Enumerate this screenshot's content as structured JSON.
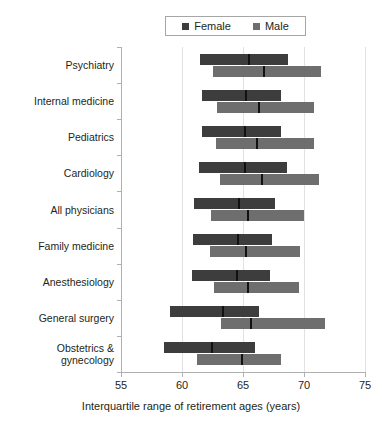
{
  "legend": {
    "items": [
      {
        "label": "Female",
        "color": "#3d3d3d",
        "swatch_name": "legend-swatch-female"
      },
      {
        "label": "Male",
        "color": "#6e6e6e",
        "swatch_name": "legend-swatch-male"
      }
    ]
  },
  "axis": {
    "x_title": "Interquartile range of retirement ages (years)",
    "x_ticks": [
      "55",
      "60",
      "65",
      "70",
      "75"
    ]
  },
  "chart_data": {
    "type": "bar",
    "subtype": "interquartile-range-bars",
    "title": "",
    "xlabel": "Interquartile range of retirement ages (years)",
    "ylabel": "",
    "xlim": [
      55,
      75
    ],
    "xticks": [
      55,
      60,
      65,
      70,
      75
    ],
    "grid": "vertical",
    "legend_position": "top-center",
    "categories": [
      "Psychiatry",
      "Internal medicine",
      "Pediatrics",
      "Cardiology",
      "All physicians",
      "Family medicine",
      "Anesthesiology",
      "General surgery",
      "Obstetrics & gynecology"
    ],
    "series": [
      {
        "name": "Female",
        "color": "#3d3d3d",
        "values": [
          {
            "category": "Psychiatry",
            "q1": 61.5,
            "median": 65.4,
            "q3": 68.7
          },
          {
            "category": "Internal medicine",
            "q1": 61.6,
            "median": 65.2,
            "q3": 68.1
          },
          {
            "category": "Pediatrics",
            "q1": 61.6,
            "median": 65.1,
            "q3": 68.1
          },
          {
            "category": "Cardiology",
            "q1": 61.4,
            "median": 65.1,
            "q3": 68.6
          },
          {
            "category": "All physicians",
            "q1": 61.0,
            "median": 64.6,
            "q3": 67.6
          },
          {
            "category": "Family medicine",
            "q1": 60.9,
            "median": 64.5,
            "q3": 67.4
          },
          {
            "category": "Anesthesiology",
            "q1": 60.8,
            "median": 64.4,
            "q3": 67.2
          },
          {
            "category": "General surgery",
            "q1": 59.0,
            "median": 63.3,
            "q3": 66.3
          },
          {
            "category": "Obstetrics & gynecology",
            "q1": 58.5,
            "median": 62.4,
            "q3": 66.0
          }
        ]
      },
      {
        "name": "Male",
        "color": "#6e6e6e",
        "values": [
          {
            "category": "Psychiatry",
            "q1": 62.5,
            "median": 66.6,
            "q3": 71.4
          },
          {
            "category": "Internal medicine",
            "q1": 62.9,
            "median": 66.2,
            "q3": 70.8
          },
          {
            "category": "Pediatrics",
            "q1": 62.8,
            "median": 66.1,
            "q3": 70.8
          },
          {
            "category": "Cardiology",
            "q1": 63.1,
            "median": 66.5,
            "q3": 71.2
          },
          {
            "category": "All physicians",
            "q1": 62.4,
            "median": 65.3,
            "q3": 70.0
          },
          {
            "category": "Family medicine",
            "q1": 62.3,
            "median": 65.2,
            "q3": 69.7
          },
          {
            "category": "Anesthesiology",
            "q1": 62.6,
            "median": 65.3,
            "q3": 69.6
          },
          {
            "category": "General surgery",
            "q1": 63.2,
            "median": 65.6,
            "q3": 71.7
          },
          {
            "category": "Obstetrics & gynecology",
            "q1": 61.2,
            "median": 64.8,
            "q3": 68.1
          }
        ]
      }
    ]
  }
}
